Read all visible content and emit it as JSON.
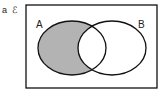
{
  "question": {
    "part_label": "a",
    "universal_symbol": "ℰ"
  },
  "venn": {
    "sets": [
      {
        "label": "A",
        "shaded": "A only"
      },
      {
        "label": "B",
        "shaded": "none"
      }
    ],
    "shaded_region": "A ∩ B'",
    "colors": {
      "shade": "#b3b3b3",
      "stroke": "#111111",
      "background": "#ffffff"
    }
  }
}
